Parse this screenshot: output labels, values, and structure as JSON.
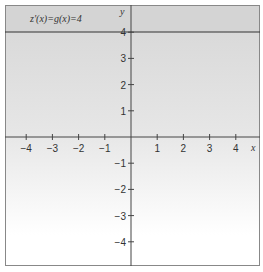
{
  "chart_data": {
    "type": "line",
    "xlabel": "x",
    "ylabel": "y",
    "xlim": [
      -4.5,
      4.8
    ],
    "ylim": [
      -4.7,
      4.3
    ],
    "x_ticks": [
      -4,
      -3,
      -2,
      -1,
      1,
      2,
      3,
      4
    ],
    "y_ticks": [
      4,
      3,
      2,
      1,
      -1,
      -2,
      -3,
      -4
    ],
    "x_tick_labels": [
      "−4",
      "−3",
      "−2",
      "−1",
      "1",
      "2",
      "3",
      "4"
    ],
    "y_tick_labels": [
      "4",
      "3",
      "2",
      "1",
      "−1",
      "−2",
      "−3",
      "−4"
    ],
    "grid": false,
    "series": [
      {
        "name": "g(x)=4",
        "x": [
          -4.5,
          4.8
        ],
        "y": [
          4,
          4
        ],
        "color": "#333333"
      }
    ],
    "shading": {
      "description": "gray gradient region above x-axis fading downward",
      "color": "#d8d8d8"
    }
  },
  "labels": {
    "equation": "z′(x)=g(x)=4",
    "x_axis": "x",
    "y_axis": "y"
  }
}
